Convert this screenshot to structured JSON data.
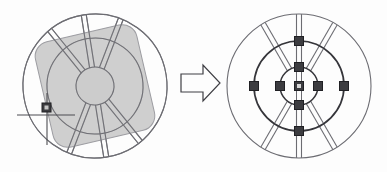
{
  "diagram": {
    "arrow": {
      "name": "transformation-arrow",
      "direction": "right",
      "label": ""
    },
    "colors": {
      "background": "#fdfdfd",
      "outline": "#6e6e72",
      "outline_dark": "#3a3a3e",
      "shade_fill": "#bdbdbd",
      "shade_stroke": "#9a9a9e",
      "marker_fill": "#3c3c40",
      "marker_stroke": "#232327",
      "crosshair": "#4a4a4e"
    },
    "left_figure": {
      "name": "wheel-before",
      "label": "",
      "center": {
        "x": 95,
        "y": 86
      },
      "outer_radius": 72,
      "mid_radius": 48,
      "hub_radius": 19,
      "rotation_deg": -9,
      "spoke_angles_deg": [
        90,
        210,
        330
      ],
      "spoke_width": 5,
      "shaded_region": {
        "name": "shaded-overlay-region",
        "rotation_deg": -13,
        "width": 104,
        "height": 108,
        "corner_radius": 14
      },
      "marker": {
        "name": "reference-point-marker",
        "x": 46,
        "y": 111,
        "size": 8,
        "crosshair_h_length": 58,
        "crosshair_v_length": 52
      }
    },
    "right_figure": {
      "name": "wheel-after",
      "label": "",
      "center": {
        "x": 299,
        "y": 86
      },
      "outer_radius": 72,
      "mid_radius": 45,
      "hub_radius": 19,
      "rotation_deg": 0,
      "spoke_angles_deg": [
        90,
        210,
        330
      ],
      "spoke_width": 5,
      "markers": {
        "name": "measurement-markers",
        "size": 8,
        "count": 9,
        "positions": [
          {
            "id": "center",
            "angle_deg": 0,
            "radius": 0
          },
          {
            "id": "hub-top",
            "angle_deg": 90,
            "radius": 19
          },
          {
            "id": "hub-bottom",
            "angle_deg": 270,
            "radius": 19
          },
          {
            "id": "hub-left",
            "angle_deg": 180,
            "radius": 19
          },
          {
            "id": "hub-right",
            "angle_deg": 0,
            "radius": 19
          },
          {
            "id": "rim-top",
            "angle_deg": 90,
            "radius": 45
          },
          {
            "id": "rim-bottom",
            "angle_deg": 270,
            "radius": 45
          },
          {
            "id": "rim-left",
            "angle_deg": 180,
            "radius": 45
          },
          {
            "id": "rim-right",
            "angle_deg": 0,
            "radius": 45
          }
        ]
      }
    }
  }
}
